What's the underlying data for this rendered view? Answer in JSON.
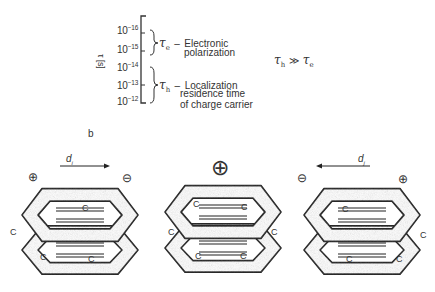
{
  "figure": {
    "panel_a": {
      "axis_label": "τ [s]",
      "ticks": [
        {
          "base": "10",
          "exp": "−16"
        },
        {
          "base": "10",
          "exp": "−15"
        },
        {
          "base": "10",
          "exp": "−14"
        },
        {
          "base": "10",
          "exp": "−13"
        },
        {
          "base": "10",
          "exp": "−12"
        }
      ],
      "tau_e": {
        "symbol": "τ",
        "sub": "e",
        "dash": "–",
        "line1": "Electronic",
        "line2": "polarization"
      },
      "tau_h": {
        "symbol": "τ",
        "sub": "h",
        "dash": "–",
        "line1": "Localization",
        "line2": "residence time",
        "line3": "of charge carrier"
      },
      "relation": {
        "left": "τ",
        "left_sub": "h",
        "op": "≫",
        "right": "τ",
        "right_sub": "e"
      }
    },
    "panel_b": {
      "label": "b",
      "left": {
        "arrow_label": "d",
        "arrow_sub": "i",
        "arrow_direction": "right",
        "plus": "⊕",
        "minus": "⊖"
      },
      "center": {
        "plus": "⊕"
      },
      "right": {
        "arrow_label": "d",
        "arrow_sub": "j",
        "arrow_direction": "left",
        "plus": "⊕",
        "minus": "⊖"
      },
      "atom_label": "C"
    }
  }
}
